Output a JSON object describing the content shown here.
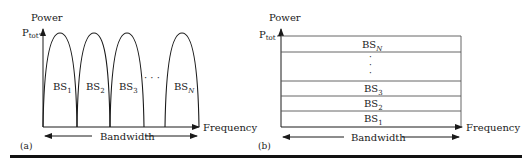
{
  "panel_a": {
    "tag": "(a)",
    "y_axis_label": "Power",
    "ptot_main": "P",
    "ptot_sub": "tot",
    "x_axis_label": "Frequency",
    "bandwidth_label": "Bandwidth",
    "ellipsis": "· · ·",
    "lobes": [
      {
        "main": "BS",
        "sub": "1"
      },
      {
        "main": "BS",
        "sub": "2"
      },
      {
        "main": "BS",
        "sub": "3"
      },
      {
        "main": "BS",
        "sub": "N"
      }
    ]
  },
  "panel_b": {
    "tag": "(b)",
    "y_axis_label": "Power",
    "ptot_main": "P",
    "ptot_sub": "tot",
    "x_axis_label": "Frequency",
    "bandwidth_label": "Bandwidth",
    "vertical_ellipsis": [
      "·",
      "·",
      "·"
    ],
    "bands": [
      {
        "main": "BS",
        "sub": "N"
      },
      {
        "main": "BS",
        "sub": "3"
      },
      {
        "main": "BS",
        "sub": "2"
      },
      {
        "main": "BS",
        "sub": "1"
      }
    ]
  },
  "colors": {
    "line": "#1a1a1a",
    "band_line": "#555555",
    "background": "#ffffff"
  }
}
